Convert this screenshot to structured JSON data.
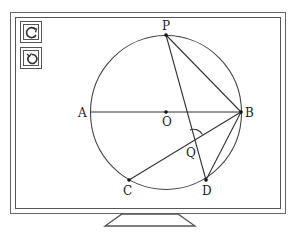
{
  "toolbar": {
    "buttons": [
      {
        "name": "rotate-clockwise",
        "icon": "rotate-cw-icon"
      },
      {
        "name": "rotate-counterclockwise",
        "icon": "rotate-ccw-icon"
      }
    ]
  },
  "diagram": {
    "circle": {
      "center": "O",
      "cx": 166,
      "cy": 112,
      "r": 76
    },
    "points": {
      "P": {
        "label": "P",
        "x": 166,
        "y": 35
      },
      "A": {
        "label": "A",
        "x": 90,
        "y": 112
      },
      "B": {
        "label": "B",
        "x": 241,
        "y": 112
      },
      "O": {
        "label": "O",
        "x": 166,
        "y": 112
      },
      "Q": {
        "label": "Q",
        "x": 193,
        "y": 140
      },
      "C": {
        "label": "C",
        "x": 129,
        "y": 180
      },
      "D": {
        "label": "D",
        "x": 206,
        "y": 180
      }
    },
    "segments": [
      "AB",
      "PB",
      "PD",
      "CB",
      "DB"
    ],
    "angle_mark": "PQB"
  },
  "colors": {
    "stroke": "#333333",
    "frame": "#555555"
  }
}
